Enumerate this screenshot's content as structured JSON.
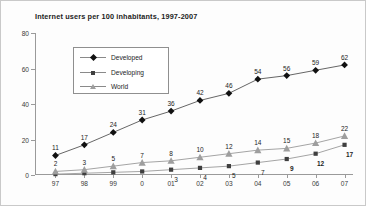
{
  "chart_data": {
    "type": "line",
    "title": "Internet users per 100 inhabitants, 1997-2007",
    "xlabel": "",
    "ylabel": "",
    "ylim": [
      0,
      80
    ],
    "yticks": [
      0,
      20,
      40,
      60,
      80
    ],
    "grid": false,
    "legend_position": "upper-left-inside",
    "categories": [
      "97",
      "98",
      "99",
      "0",
      "01",
      "02",
      "03",
      "04",
      "05",
      "06",
      "07"
    ],
    "series": [
      {
        "name": "Developed",
        "marker": "diamond",
        "color": "#111111",
        "values": [
          11,
          17,
          24,
          31,
          36,
          42,
          46,
          54,
          56,
          59,
          62
        ],
        "labels": [
          "11",
          "17",
          "24",
          "31",
          "36",
          "42",
          "46",
          "54",
          "56",
          "59",
          "62"
        ]
      },
      {
        "name": "Developing",
        "marker": "square",
        "color": "#3f3f3f",
        "values": [
          0.5,
          1,
          1.5,
          2,
          3,
          4,
          5,
          7,
          9,
          12,
          17
        ],
        "labels": [
          "",
          "",
          "",
          "",
          "3",
          "4",
          "5",
          "7",
          "9",
          "12",
          "17"
        ]
      },
      {
        "name": "World",
        "marker": "triangle",
        "color": "#9e9e9e",
        "values": [
          2,
          3,
          5,
          7,
          8,
          10,
          12,
          14,
          15,
          18,
          22
        ],
        "labels": [
          "2",
          "3",
          "5",
          "7",
          "8",
          "10",
          "12",
          "14",
          "15",
          "18",
          "22"
        ]
      }
    ]
  },
  "legend": {
    "items": [
      {
        "label": "Developed",
        "marker": "diamond-marker-icon"
      },
      {
        "label": "Developing",
        "marker": "square-marker-icon"
      },
      {
        "label": "World",
        "marker": "triangle-marker-icon"
      }
    ]
  }
}
